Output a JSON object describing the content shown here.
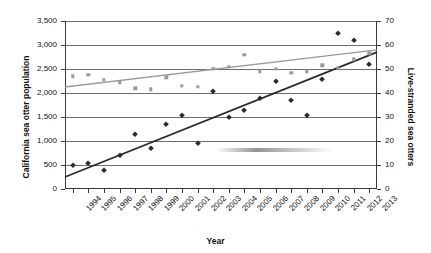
{
  "chart_data": {
    "type": "scatter",
    "title": "",
    "xlabel": "Year",
    "ylabel": "California sea otter population",
    "y2label": "Live-stranded sea otters",
    "grid": true,
    "legend": "none",
    "x": [
      1994,
      1995,
      1996,
      1997,
      1998,
      1999,
      2000,
      2001,
      2002,
      2003,
      2004,
      2005,
      2006,
      2007,
      2008,
      2009,
      2010,
      2011,
      2012,
      2013
    ],
    "xtick_labels": [
      "1994",
      "1995",
      "1996",
      "1997",
      "1998",
      "1999",
      "2000",
      "2001",
      "2002",
      "2003",
      "2004",
      "2005",
      "2006",
      "2007",
      "2008",
      "2009",
      "2010",
      "2011",
      "2012",
      "2013"
    ],
    "ylim": [
      0,
      3500
    ],
    "ytick_labels": [
      "0",
      "500",
      "1,000",
      "1,500",
      "2,000",
      "2,500",
      "3,000",
      "3,500"
    ],
    "ytick_values": [
      0,
      500,
      1000,
      1500,
      2000,
      2500,
      3000,
      3500
    ],
    "y2lim": [
      0,
      70
    ],
    "y2tick_labels": [
      "0",
      "10",
      "20",
      "30",
      "40",
      "50",
      "60",
      "70"
    ],
    "y2tick_values": [
      0,
      10,
      20,
      30,
      40,
      50,
      60,
      70
    ],
    "series": [
      {
        "name": "California sea otter population",
        "axis": "left",
        "marker": "square",
        "color": "#9a9a9a",
        "values": [
          2350,
          2375,
          2275,
          2225,
          2100,
          2075,
          2325,
          2150,
          2125,
          2500,
          2550,
          2800,
          2450,
          2500,
          2425,
          2450,
          2575,
          2525,
          2700,
          2825
        ],
        "trendline": {
          "start": 2125,
          "end": 2900,
          "color": "#9a9a9a"
        }
      },
      {
        "name": "Live-stranded sea otters",
        "axis": "right",
        "marker": "diamond",
        "color": "#2b2b2b",
        "values": [
          10,
          11,
          8,
          14,
          23,
          17,
          27,
          31,
          19,
          41,
          30,
          33,
          38,
          45,
          37,
          31,
          46,
          65,
          62,
          52
        ],
        "trendline": {
          "start": 5,
          "end": 57,
          "color": "#2b2b2b"
        }
      }
    ]
  },
  "axes": {
    "x_title": "Year",
    "y_left_title": "California sea otter population",
    "y_right_title": "Live-stranded sea otters"
  }
}
